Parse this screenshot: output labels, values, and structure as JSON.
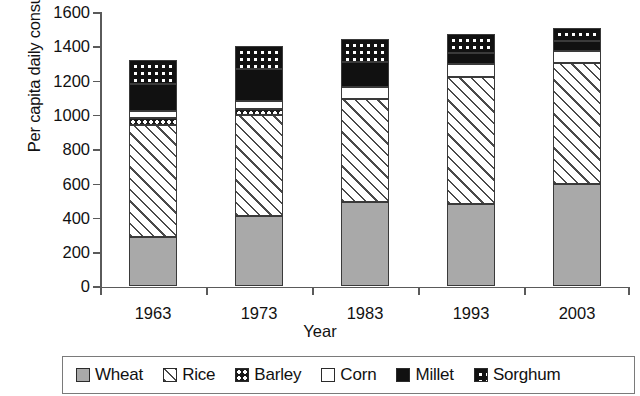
{
  "chart_data": {
    "type": "bar",
    "subtype": "stacked-bar",
    "title": "",
    "xlabel": "Year",
    "ylabel": "Per capita daily consumption",
    "categories": [
      "1963",
      "1973",
      "1983",
      "1993",
      "2003"
    ],
    "ylim": [
      0,
      1600
    ],
    "yticks": [
      0,
      200,
      400,
      600,
      800,
      1000,
      1200,
      1400,
      1600
    ],
    "grid": false,
    "legend_position": "bottom",
    "series": [
      {
        "name": "Wheat",
        "pattern": "solid-gray",
        "values": [
          290,
          410,
          490,
          480,
          600
        ]
      },
      {
        "name": "Rice",
        "pattern": "diagonal-hatch",
        "values": [
          650,
          590,
          600,
          740,
          705
        ]
      },
      {
        "name": "Barley",
        "pattern": "checkered",
        "values": [
          40,
          35,
          0,
          0,
          0
        ]
      },
      {
        "name": "Corn",
        "pattern": "white",
        "values": [
          40,
          45,
          70,
          75,
          70
        ]
      },
      {
        "name": "Millet",
        "pattern": "solid-black",
        "values": [
          160,
          190,
          150,
          65,
          55
        ]
      },
      {
        "name": "Sorghum",
        "pattern": "black-dotted",
        "values": [
          140,
          130,
          130,
          110,
          75
        ]
      }
    ],
    "totals": [
      1320,
      1400,
      1440,
      1470,
      1505
    ],
    "colors": {
      "wheat": "#a9a9a9",
      "rice": "#ffffff",
      "barley": "#1b1b1b",
      "corn": "#ffffff",
      "millet": "#111111",
      "sorghum": "#111111",
      "outline": "#3a3a3a",
      "axis": "#5a5a5a"
    }
  },
  "axes": {
    "y_title": "Per capita daily consumption",
    "x_title": "Year",
    "y_tick_labels": [
      "1600",
      "1400",
      "1200",
      "1000",
      "800",
      "600",
      "400",
      "200",
      "0"
    ],
    "x_tick_labels": [
      "1963",
      "1973",
      "1983",
      "1993",
      "2003"
    ]
  },
  "legend": {
    "items": [
      {
        "label": "Wheat",
        "swatch": "gray-square-swatch"
      },
      {
        "label": "Rice",
        "swatch": "hatched-square-swatch"
      },
      {
        "label": "Barley",
        "swatch": "checkered-square-swatch"
      },
      {
        "label": "Corn",
        "swatch": "white-square-swatch"
      },
      {
        "label": "Millet",
        "swatch": "black-square-swatch"
      },
      {
        "label": "Sorghum",
        "swatch": "dotted-black-square-swatch"
      }
    ]
  }
}
